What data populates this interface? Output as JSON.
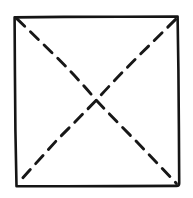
{
  "figure": {
    "background_color": "#ffffff",
    "stroke_color": "#151515",
    "canvas": {
      "width": 193,
      "height": 198
    },
    "square": {
      "name": "paper-sheet",
      "stroke_color": "#151515",
      "stroke_width": 2.6,
      "corners": {
        "top_left": [
          14,
          16
        ],
        "top_right": [
          178,
          17
        ],
        "bottom_right": [
          179,
          185
        ],
        "bottom_left": [
          16,
          186
        ]
      },
      "path": "M14.5,17.5 L178,16.8 L179,184 Q179,186 177,186 L16.4,186 Z"
    },
    "diagonals": [
      {
        "name": "fold-diagonal-tl-br",
        "from": [
          17,
          19
        ],
        "to": [
          176,
          183
        ],
        "style": "dashed",
        "stroke_color": "#171717",
        "stroke_width": 2.9,
        "dash_length": 11,
        "gap_length": 8,
        "path": "M17,19 L60,63 Q78,82 96.5,100.5 Q115,119 133,137 L176,183"
      },
      {
        "name": "fold-diagonal-tr-bl",
        "from": [
          175,
          20
        ],
        "to": [
          18,
          183
        ],
        "style": "dashed",
        "stroke_color": "#171717",
        "stroke_width": 2.9,
        "dash_length": 11,
        "gap_length": 8,
        "path": "M175,20 L133,63 Q115,82 96.5,100.5 Q78,119 60,137 L18,183"
      }
    ],
    "intersection": {
      "name": "fold-center-point",
      "point": [
        96,
        100
      ]
    }
  }
}
